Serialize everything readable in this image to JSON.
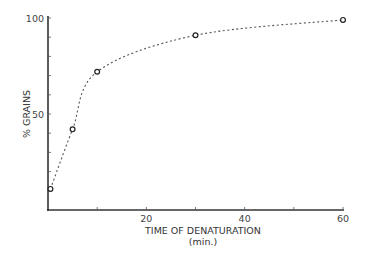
{
  "chart_data": {
    "type": "line",
    "title": "",
    "xlabel": "TIME OF DENATURATION",
    "xlabel_unit": "(min.)",
    "ylabel": "% GRAINS",
    "x": [
      0.5,
      5,
      10,
      30,
      60
    ],
    "series": [
      {
        "name": "% grains",
        "values": [
          11,
          42,
          72,
          91,
          99
        ],
        "marker": "open-circle",
        "line_style": "dotted"
      }
    ],
    "xlim": [
      0,
      60
    ],
    "ylim": [
      0,
      100
    ],
    "x_ticks": [
      0,
      10,
      20,
      30,
      40,
      50,
      60
    ],
    "x_tick_labels": [
      "20",
      "40",
      "60"
    ],
    "x_tick_label_values": [
      20,
      40,
      60
    ],
    "y_ticks": [
      0,
      10,
      20,
      30,
      40,
      50,
      60,
      70,
      80,
      90,
      100
    ],
    "y_tick_labels": [
      "50",
      "100"
    ],
    "y_tick_label_values": [
      50,
      100
    ],
    "grid": false,
    "legend": null
  }
}
